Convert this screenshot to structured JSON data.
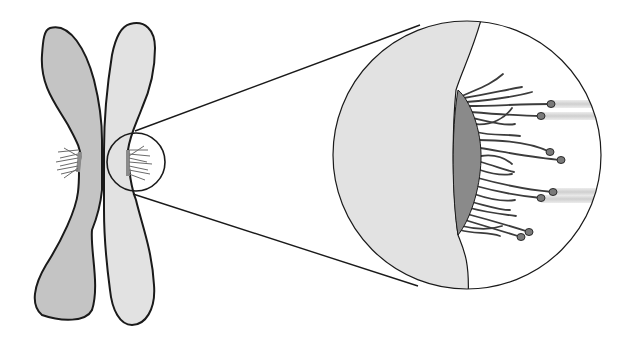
{
  "diagram": {
    "colors": {
      "background": "#ffffff",
      "left_chromatid": "#c4c4c4",
      "right_chromatid": "#e2e2e2",
      "kinetochore_plate": "#8a8a8a",
      "outline": "#1a1a1a",
      "fibers": "#3c3c3c",
      "fiber_knob": "#7a7a7a",
      "microtubule_beam": "#d8d8d8"
    },
    "elements": [
      {
        "name": "left-chromatid",
        "label": "Left sister chromatid"
      },
      {
        "name": "right-chromatid",
        "label": "Right sister chromatid"
      },
      {
        "name": "magnify-circle-small",
        "label": "Magnified region marker",
        "cx": 136,
        "cy": 162,
        "r": 29
      },
      {
        "name": "magnify-circle-large",
        "label": "Magnified kinetochore view",
        "cx": 467,
        "cy": 155,
        "r": 134
      },
      {
        "name": "kinetochore-plate",
        "label": "Kinetochore"
      },
      {
        "name": "fibrous-corona",
        "label": "Kinetochore fibers"
      },
      {
        "name": "microtubule-ends",
        "label": "Microtubule plus ends",
        "count": 8
      }
    ]
  }
}
